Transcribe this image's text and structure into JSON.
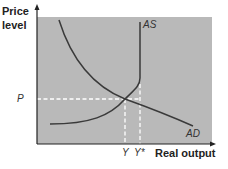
{
  "diagram": {
    "type": "AD-AS model",
    "y_axis_label_line1": "Price",
    "y_axis_label_line2": "level",
    "x_axis_label": "Real output",
    "curves": [
      {
        "name": "AS",
        "label": "AS"
      },
      {
        "name": "AD",
        "label": "AD"
      }
    ],
    "price_label": "P",
    "output_labels": {
      "equilibrium": "Y",
      "full_employment": "Y*"
    },
    "colors": {
      "panel": "#b9b9b9",
      "curve": "#3a3a3a",
      "axis": "#222222",
      "dashed": "#ffffff"
    }
  }
}
